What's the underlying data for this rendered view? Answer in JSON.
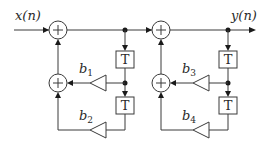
{
  "diagram": {
    "type": "cascade of two second-order recursive (all-pole) sections",
    "input_label": "x(n)",
    "output_label": "y(n)",
    "delay_label": "T",
    "sections": [
      {
        "coefficients": [
          {
            "base": "b",
            "sub": "1"
          },
          {
            "base": "b",
            "sub": "2"
          }
        ]
      },
      {
        "coefficients": [
          {
            "base": "b",
            "sub": "3"
          },
          {
            "base": "b",
            "sub": "4"
          }
        ]
      }
    ],
    "colors": {
      "line": "#3a3a3a",
      "dot": "#1a1a1a",
      "background": "#ffffff"
    }
  }
}
